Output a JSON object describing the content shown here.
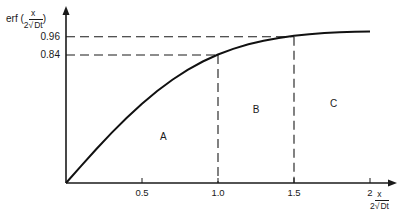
{
  "chart_data": {
    "type": "line",
    "title": "",
    "ylabel": {
      "prefix": "erf (",
      "num": "x",
      "den_coef": "2",
      "den_root": "Dt",
      "suffix": ")"
    },
    "xlabel": {
      "num": "x",
      "den_coef": "2",
      "den_root": "Dt"
    },
    "x_ticks": [
      {
        "value": 0.5,
        "label": "0.5"
      },
      {
        "value": 1.0,
        "label": "1.0"
      },
      {
        "value": 1.5,
        "label": "1.5"
      },
      {
        "value": 2.0,
        "label": "2"
      }
    ],
    "y_ticks": [
      {
        "value": 0.84,
        "label": "0.84"
      },
      {
        "value": 0.96,
        "label": "0.96"
      }
    ],
    "xlim": [
      0,
      2.15
    ],
    "ylim": [
      0,
      1.15
    ],
    "grid": false,
    "series": [
      {
        "name": "erf",
        "x": [
          0,
          0.1,
          0.2,
          0.3,
          0.4,
          0.5,
          0.6,
          0.7,
          0.8,
          0.9,
          1.0,
          1.1,
          1.2,
          1.3,
          1.4,
          1.5,
          1.6,
          1.7,
          1.8,
          1.9,
          2.0
        ],
        "y": [
          0,
          0.112,
          0.223,
          0.329,
          0.428,
          0.52,
          0.604,
          0.678,
          0.742,
          0.797,
          0.843,
          0.88,
          0.91,
          0.934,
          0.952,
          0.966,
          0.976,
          0.984,
          0.989,
          0.993,
          0.995
        ]
      }
    ],
    "reference_lines": [
      {
        "type": "horizontal",
        "y": 0.84,
        "x_to": 1.0,
        "style": "dashed"
      },
      {
        "type": "horizontal",
        "y": 0.96,
        "x_to": 1.5,
        "style": "dashed"
      },
      {
        "type": "vertical",
        "x": 1.0,
        "y_to": 0.84,
        "style": "dashed"
      },
      {
        "type": "vertical",
        "x": 1.5,
        "y_to": 0.96,
        "style": "dashed"
      }
    ],
    "annotations": [
      {
        "text": "A",
        "x": 0.64,
        "y": 0.3
      },
      {
        "text": "B",
        "x": 1.25,
        "y": 0.48
      },
      {
        "text": "C",
        "x": 1.76,
        "y": 0.52
      }
    ]
  }
}
